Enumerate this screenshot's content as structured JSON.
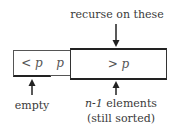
{
  "diagram": {
    "top_label": "recurse on these",
    "cells": [
      {
        "id": "less",
        "label_op": "<",
        "label_var": "p"
      },
      {
        "id": "pivot",
        "label_var": "p"
      },
      {
        "id": "greater",
        "label_op": ">",
        "label_var": "p"
      }
    ],
    "bottom_left_label": "empty",
    "bottom_right_label_var": "n-1",
    "bottom_right_label_rest": " elements",
    "bottom_right_label_line2": "(still sorted)",
    "colors": {
      "stroke": "#2a2a2a",
      "text": "#3a3a3a"
    }
  }
}
